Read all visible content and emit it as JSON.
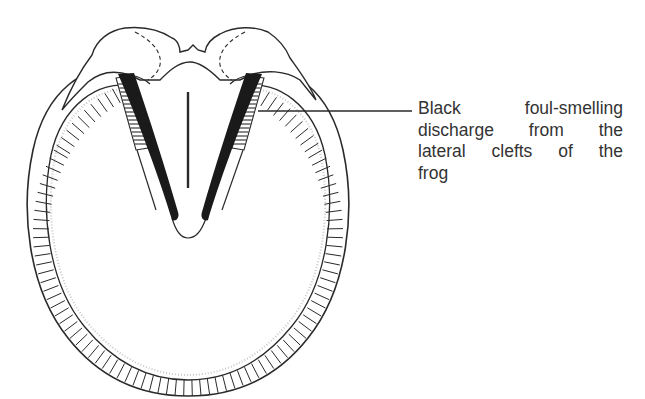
{
  "figure": {
    "annotation": {
      "lines": [
        "Black   foul-smelling",
        "discharge  from  the",
        "lateral  clefts  of  the",
        "frog"
      ],
      "pointer_target": "lateral-cleft-of-frog"
    },
    "colors": {
      "ink": "#2a2a2a",
      "discharge": "#1a1a1a",
      "text": "#333333",
      "background": "#ffffff"
    },
    "parts": [
      "hoof-wall",
      "heel-bulbs",
      "frog",
      "lateral-clefts",
      "central-sulcus",
      "sole",
      "bars"
    ]
  }
}
